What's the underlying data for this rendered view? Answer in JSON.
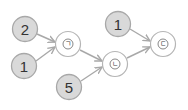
{
  "diagram": {
    "type": "flow-addition",
    "colors": {
      "number_fill": "#d9d9d9",
      "number_stroke": "#a8a8a8",
      "result_fill": "#ffffff",
      "result_stroke": "#b5b5b5",
      "edge": "#a8a8a8"
    },
    "nodes": {
      "n2": {
        "label": "2",
        "kind": "number",
        "x": 25,
        "y": 29
      },
      "n1a": {
        "label": "1",
        "kind": "number",
        "x": 24,
        "y": 66
      },
      "giyeok": {
        "label": "ㄱ",
        "kind": "result",
        "x": 68,
        "y": 44
      },
      "n5": {
        "label": "5",
        "kind": "number",
        "x": 69,
        "y": 87
      },
      "nieun": {
        "label": "ㄴ",
        "kind": "result",
        "x": 115,
        "y": 64
      },
      "n1b": {
        "label": "1",
        "kind": "number",
        "x": 118,
        "y": 24
      },
      "digeut": {
        "label": "ㄷ",
        "kind": "result",
        "x": 163,
        "y": 44
      }
    },
    "edges": [
      {
        "from": "n2",
        "to": "giyeok"
      },
      {
        "from": "n1a",
        "to": "giyeok"
      },
      {
        "from": "giyeok",
        "to": "nieun"
      },
      {
        "from": "n5",
        "to": "nieun"
      },
      {
        "from": "nieun",
        "to": "digeut"
      },
      {
        "from": "n1b",
        "to": "digeut"
      }
    ]
  }
}
